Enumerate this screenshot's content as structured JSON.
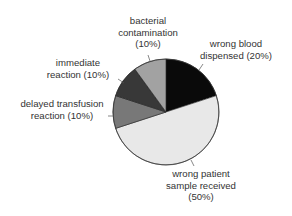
{
  "chart_data": {
    "type": "pie",
    "title": "",
    "start_angle_deg": 0,
    "direction": "clockwise",
    "slices": [
      {
        "label": "wrong blood dispensed",
        "value": 20,
        "display": "(20%)",
        "color": "#0a0a0a"
      },
      {
        "label": "wrong patient sample received",
        "value": 50,
        "display": "(50%)",
        "color": "#e8e8e8"
      },
      {
        "label": "delayed transfusion reaction",
        "value": 10,
        "display": "(10%)",
        "color": "#787878"
      },
      {
        "label": "immediate reaction",
        "value": 10,
        "display": "(10%)",
        "color": "#383838"
      },
      {
        "label": "bacterial contamination",
        "value": 10,
        "display": "(10%)",
        "color": "#a2a2a2"
      }
    ],
    "legend": "none (inline callout labels)"
  },
  "labels": {
    "bacterial": {
      "line1": "bacterial",
      "line2": "contamination",
      "line3": "(10%)"
    },
    "wrong_blood": {
      "line1": "wrong blood",
      "line2": "dispensed (20%)"
    },
    "immediate": {
      "line1": "immediate",
      "line2": "reaction (10%)"
    },
    "delayed": {
      "line1": "delayed transfusion",
      "line2": "reaction (10%)"
    },
    "wrong_patient": {
      "line1": "wrong patient",
      "line2": "sample received",
      "line3": "(50%)"
    }
  }
}
